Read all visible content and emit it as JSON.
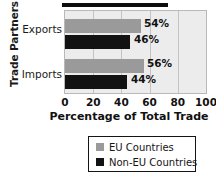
{
  "chart_data": {
    "type": "bar",
    "orientation": "horizontal",
    "title": "",
    "xlabel": "Percentage of Total Trade",
    "ylabel": "Trade Partners",
    "categories": [
      "Exports",
      "Imports"
    ],
    "series": [
      {
        "name": "EU Countries",
        "color": "#9a9a9a",
        "values": [
          54,
          56
        ],
        "labels": [
          "54%",
          "56%"
        ]
      },
      {
        "name": "Non-EU Countries",
        "color": "#121212",
        "values": [
          46,
          44
        ],
        "labels": [
          "46%",
          "44%"
        ]
      }
    ],
    "xlim": [
      0,
      100
    ],
    "xticks": [
      0,
      20,
      40,
      60,
      80,
      100
    ],
    "xtick_labels": [
      "0",
      "20",
      "40",
      "60",
      "80",
      "100"
    ],
    "grid": true,
    "legend_position": "bottom",
    "plot_background": "#ececed",
    "gridline_color": "#c3c3c4"
  },
  "axes": {
    "y_title": "Trade Partners",
    "x_title": "Percentage of Total Trade",
    "categories": [
      {
        "label": "Exports"
      },
      {
        "label": "Imports"
      }
    ],
    "ticks": [
      {
        "label": "0"
      },
      {
        "label": "20"
      },
      {
        "label": "40"
      },
      {
        "label": "60"
      },
      {
        "label": "80"
      },
      {
        "label": "100"
      }
    ]
  },
  "bars": {
    "exports_eu": "54%",
    "exports_noneu": "46%",
    "imports_eu": "56%",
    "imports_noneu": "44%"
  },
  "legend": {
    "items": [
      {
        "label": "EU Countries",
        "color": "#9a9a9a"
      },
      {
        "label": "Non-EU Countries",
        "color": "#121212"
      }
    ]
  }
}
